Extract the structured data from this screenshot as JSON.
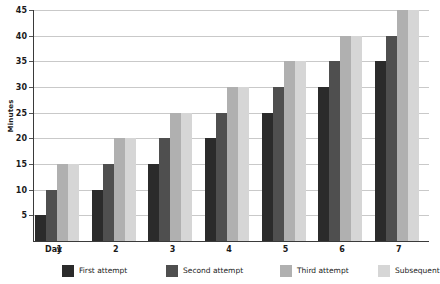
{
  "chart_data": {
    "type": "bar",
    "title": "",
    "xlabel": "Day",
    "ylabel": "Minutes",
    "categories": [
      "1",
      "2",
      "3",
      "4",
      "5",
      "6",
      "7"
    ],
    "series": [
      {
        "name": "First attempt",
        "color": "#2b2b2b",
        "values": [
          5,
          10,
          15,
          20,
          25,
          30,
          35
        ]
      },
      {
        "name": "Second attempt",
        "color": "#4f4f4f",
        "values": [
          10,
          15,
          20,
          25,
          30,
          35,
          40
        ]
      },
      {
        "name": "Third attempt",
        "color": "#b0b0b0",
        "values": [
          15,
          20,
          25,
          30,
          35,
          40,
          45
        ]
      },
      {
        "name": "Subsequent",
        "color": "#d6d6d6",
        "values": [
          15,
          20,
          25,
          30,
          35,
          40,
          45
        ]
      }
    ],
    "ylim": [
      0,
      45
    ],
    "yticks": [
      5,
      10,
      15,
      20,
      25,
      30,
      35,
      40,
      45
    ],
    "grid": true,
    "legend_position": "bottom",
    "axis_color": "#3a3a3a",
    "gridline_color": "#c9c9c9",
    "background": "#ffffff"
  },
  "axes": {
    "y_title": "Minutes",
    "x_title": "Day"
  },
  "legend": {
    "items": [
      {
        "label": "First attempt"
      },
      {
        "label": "Second attempt"
      },
      {
        "label": "Third attempt"
      },
      {
        "label": "Subsequent"
      }
    ]
  }
}
